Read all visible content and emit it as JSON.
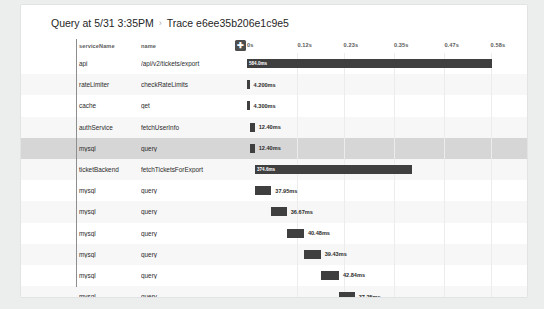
{
  "breadcrumb": {
    "parent": "Query at 5/31 3:35PM",
    "separator": "›",
    "current": "Trace e6ee35b206e1c9e5"
  },
  "table": {
    "columns": {
      "service": "serviceName",
      "name": "name"
    },
    "expand_button": "✚"
  },
  "chart_data": {
    "type": "bar",
    "title": "Trace e6ee35b206e1c9e5",
    "xlabel": "",
    "ylabel": "",
    "orientation": "horizontal",
    "axis_unit": "s",
    "xlim": [
      0,
      0.6
    ],
    "ticks": [
      {
        "label": "0s",
        "value": 0.0
      },
      {
        "label": "0.12s",
        "value": 0.12
      },
      {
        "label": "0.23s",
        "value": 0.23
      },
      {
        "label": "0.35s",
        "value": 0.35
      },
      {
        "label": "0.47s",
        "value": 0.47
      },
      {
        "label": "0.58s",
        "value": 0.58
      }
    ],
    "grid": true,
    "legend": "none",
    "spans": [
      {
        "service": "api",
        "name": "/api/v2/tickets/export",
        "start_ms": 0.0,
        "duration_ms": 584.0,
        "duration_label": "584.0ms",
        "depth": 0,
        "selected": false,
        "label_inside": true
      },
      {
        "service": "rateLimiter",
        "name": "checkRateLimits",
        "start_ms": 1.0,
        "duration_ms": 4.2,
        "duration_label": "4.200ms",
        "depth": 1,
        "selected": false,
        "label_inside": false
      },
      {
        "service": "cache",
        "name": "get",
        "start_ms": 1.0,
        "duration_ms": 4.3,
        "duration_label": "4.300ms",
        "depth": 1,
        "selected": false,
        "label_inside": false
      },
      {
        "service": "authService",
        "name": "fetchUserInfo",
        "start_ms": 6.0,
        "duration_ms": 12.4,
        "duration_label": "12.40ms",
        "depth": 1,
        "selected": false,
        "label_inside": false
      },
      {
        "service": "mysql",
        "name": "query",
        "start_ms": 6.0,
        "duration_ms": 12.4,
        "duration_label": "12.40ms",
        "depth": 2,
        "selected": true,
        "label_inside": false
      },
      {
        "service": "ticketBackend",
        "name": "fetchTicketsForExport",
        "start_ms": 19.0,
        "duration_ms": 374.6,
        "duration_label": "374.6ms",
        "depth": 1,
        "selected": false,
        "label_inside": true
      },
      {
        "service": "mysql",
        "name": "query",
        "start_ms": 20.0,
        "duration_ms": 37.95,
        "duration_label": "37.95ms",
        "depth": 2,
        "selected": false,
        "label_inside": false
      },
      {
        "service": "mysql",
        "name": "query",
        "start_ms": 58.0,
        "duration_ms": 36.67,
        "duration_label": "36.67ms",
        "depth": 2,
        "selected": false,
        "label_inside": false
      },
      {
        "service": "mysql",
        "name": "query",
        "start_ms": 95.0,
        "duration_ms": 40.48,
        "duration_label": "40.48ms",
        "depth": 2,
        "selected": false,
        "label_inside": false
      },
      {
        "service": "mysql",
        "name": "query",
        "start_ms": 136.0,
        "duration_ms": 39.43,
        "duration_label": "39.43ms",
        "depth": 2,
        "selected": false,
        "label_inside": false
      },
      {
        "service": "mysql",
        "name": "query",
        "start_ms": 176.0,
        "duration_ms": 42.84,
        "duration_label": "42.84ms",
        "depth": 2,
        "selected": false,
        "label_inside": false
      },
      {
        "service": "mysql",
        "name": "query",
        "start_ms": 219.0,
        "duration_ms": 37.25,
        "duration_label": "37.25ms",
        "depth": 2,
        "selected": false,
        "label_inside": false
      },
      {
        "service": "mysql",
        "name": "query",
        "start_ms": 257.0,
        "duration_ms": 35.92,
        "duration_label": "35.92ms",
        "depth": 2,
        "selected": false,
        "label_inside": false
      },
      {
        "service": "mysql",
        "name": "query",
        "start_ms": 293.0,
        "duration_ms": 40.0,
        "duration_label": "40.00ms",
        "depth": 2,
        "selected": false,
        "label_inside": false
      },
      {
        "service": "mysql",
        "name": "query",
        "start_ms": 333.0,
        "duration_ms": 39.83,
        "duration_label": "39.83ms",
        "depth": 2,
        "selected": false,
        "label_inside": false,
        "label_left": true
      },
      {
        "service": "fraud",
        "name": "checkFraud",
        "start_ms": 452.0,
        "duration_ms": 102.0,
        "duration_label": "102.0ms",
        "depth": 1,
        "selected": false,
        "label_inside": true
      }
    ]
  },
  "colors": {
    "bar": "#3f3f3f",
    "selected_row": "#d6d6d6",
    "alt_row": "#f7f7f7",
    "page_bg": "#eceded",
    "card_bg": "#ffffff"
  }
}
